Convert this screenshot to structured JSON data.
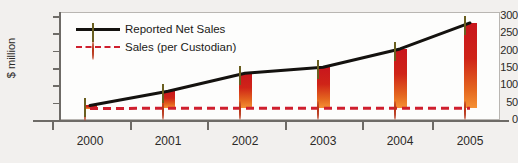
{
  "chart_data": {
    "type": "line",
    "title": "",
    "xlabel": "",
    "ylabel": "$ million",
    "categories": [
      "2000",
      "2001",
      "2002",
      "2003",
      "2004",
      "2005"
    ],
    "yticks": [
      "0",
      "50",
      "100",
      "150",
      "200",
      "250",
      "300"
    ],
    "ylim": [
      0,
      300
    ],
    "grid": false,
    "legend_position": "top-left",
    "series": [
      {
        "name": "Reported Net Sales",
        "values": [
          42,
          83,
          135,
          152,
          205,
          280
        ],
        "color": "#14120f",
        "marker": "diamond",
        "marker_color": "#e8dc91",
        "line_style": "solid"
      },
      {
        "name": "Sales (per Custodian)",
        "values": [
          33,
          34,
          34,
          34,
          34,
          34
        ],
        "color": "#cf1f2e",
        "marker": "circle",
        "marker_color": "#f08a2a",
        "line_style": "dashed"
      }
    ],
    "annotations": {
      "connector_bars": "red-orange gradient bars linking the two series at each year"
    }
  },
  "legend": {
    "items": [
      {
        "label": "Reported Net Sales",
        "icon": "diamond-marker-icon"
      },
      {
        "label": "Sales (per Custodian)",
        "icon": "circle-marker-icon"
      }
    ]
  },
  "axes": {
    "y_title": "$ million"
  }
}
